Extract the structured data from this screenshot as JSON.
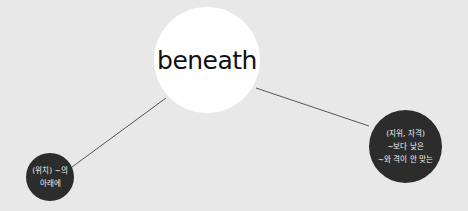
{
  "diagram": {
    "center": {
      "label": "beneath"
    },
    "branches": [
      {
        "lines": [
          "(위치) ~의",
          "아래에"
        ]
      },
      {
        "lines": [
          "(지위, 자격)",
          "~보다 낮은",
          "~와 격이 안 맞는"
        ]
      }
    ]
  },
  "colors": {
    "background": "#e8e8e8",
    "center_fill": "#ffffff",
    "branch_fill": "#2c2c2c",
    "line": "#555555"
  }
}
